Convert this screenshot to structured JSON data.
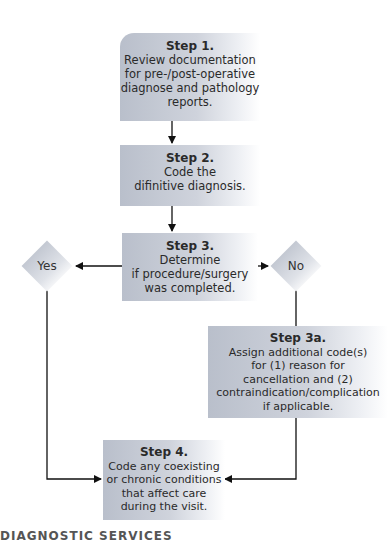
{
  "steps": {
    "step1": {
      "title": "Step 1.",
      "body": "Review documentation\nfor pre-/post-operative\ndiagnose and pathology\nreports."
    },
    "step2": {
      "title": "Step 2.",
      "body": "Code the\ndifinitive diagnosis."
    },
    "step3": {
      "title": "Step 3.",
      "body": "Determine\nif procedure/surgery\nwas completed."
    },
    "step3a": {
      "title": "Step 3a.",
      "body": "Assign additional code(s)\nfor (1) reason for\ncancellation and (2)\ncontraindication/complication\nif applicable."
    },
    "step4": {
      "title": "Step 4.",
      "body": "Code any coexisting\nor chronic conditions\nthat affect care\nduring the visit."
    }
  },
  "decisions": {
    "yes": "Yes",
    "no": "No"
  },
  "footer": "DIAGNOSTIC SERVICES"
}
